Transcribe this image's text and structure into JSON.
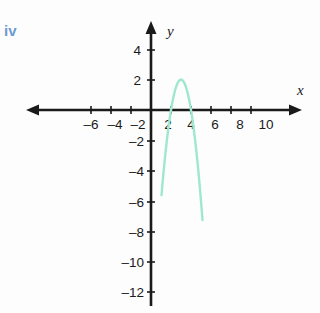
{
  "page": {
    "cropped_top_text": "",
    "part_label": "iv"
  },
  "colors": {
    "curve": "#9fe8cf",
    "axis": "#1a1a1a",
    "part_label": "#6b9ad2",
    "background": "#fdfdfd"
  },
  "axis_names": {
    "x": "x",
    "y": "y"
  },
  "chart_data": {
    "type": "line",
    "title": "",
    "subtitle": "",
    "xlabel": "x",
    "ylabel": "y",
    "xlim": [
      -7.5,
      11.5
    ],
    "ylim": [
      -13.5,
      5.5
    ],
    "grid": false,
    "legend": null,
    "x_ticks": [
      -6,
      -4,
      -2,
      2,
      4,
      6,
      8,
      10
    ],
    "x_tick_labels": [
      "–6",
      "–4",
      "–2",
      "2",
      "4",
      "6",
      "8",
      "10"
    ],
    "y_ticks": [
      4,
      2,
      -2,
      -4,
      -6,
      -8,
      -10,
      -12
    ],
    "y_tick_labels": [
      "4",
      "2",
      "–2",
      "–4",
      "–6",
      "–8",
      "–10",
      "–12"
    ],
    "series": [
      {
        "name": "parabola",
        "type": "parabola",
        "equation": "y = -2(x - 3)^2 + 2",
        "vertex": [
          3,
          2
        ],
        "roots": [
          2,
          4
        ],
        "y_intercept": -16,
        "opens": "down",
        "color": "#9fe8cf",
        "x": [
          1.2,
          1.4,
          1.6,
          1.8,
          2.0,
          2.2,
          2.4,
          2.6,
          2.8,
          3.0,
          3.2,
          3.4,
          3.6,
          3.8,
          4.0,
          4.2,
          4.4,
          4.6,
          4.8,
          5.0
        ],
        "y": [
          -4.48,
          -3.12,
          -1.92,
          -0.88,
          0.0,
          0.72,
          1.28,
          1.68,
          1.92,
          2.0,
          1.92,
          1.68,
          1.28,
          0.72,
          0.0,
          -0.88,
          -1.92,
          -3.12,
          -4.48,
          -6.0
        ]
      }
    ],
    "annotations": []
  }
}
